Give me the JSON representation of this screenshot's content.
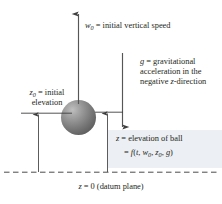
{
  "figure": {
    "background_color": "#ffffff",
    "ink_color": "#231f20",
    "highlight_color": "#eceff3",
    "ball_color": "#757575"
  },
  "labels": {
    "initial_speed": {
      "symbol": "w",
      "subscript": "0",
      "text": " = initial vertical speed",
      "full": "w0 = initial vertical speed"
    },
    "gravity": {
      "symbol": "g",
      "text": " = gravitational acceleration in the negative ",
      "symbol2": "z",
      "text2": "-direction",
      "full": "g = gravitational acceleration in the negative z-direction"
    },
    "initial_elevation": {
      "symbol": "z",
      "subscript": "0",
      "text": " = initial elevation",
      "full": "z0 = initial elevation"
    },
    "elevation": {
      "symbol": "z",
      "text": " = elevation of ball",
      "full": "z = elevation of ball"
    },
    "elevation_function": {
      "prefix": "= ",
      "fn": "f",
      "open": "(",
      "arg1": "t",
      "sep1": ", ",
      "arg2": "w",
      "arg2sub": "0",
      "sep2": ", ",
      "arg3": "z",
      "arg3sub": "0",
      "sep3": ", ",
      "arg4": "g",
      "close": ")",
      "full": "= f(t, w0, z0, g)"
    },
    "datum": {
      "symbol": "z",
      "text": " = 0 (datum plane)",
      "full": "z = 0 (datum plane)"
    }
  },
  "elements": {
    "velocity_arrow": "upward velocity vector",
    "gravity_arrow": "downward gravity vector",
    "z0_dimension_arrow": "initial elevation dimension arrow",
    "z_dimension_arrow": "current elevation dimension arrow",
    "datum_line": "dashed datum plane line",
    "ball": "ball"
  }
}
